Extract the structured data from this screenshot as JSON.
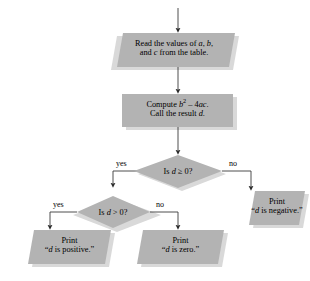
{
  "diagram": {
    "colors": {
      "shape_fill": "#b3b3b3",
      "shape_shadow": "#d9d9d9",
      "line": "#3a3a3a",
      "text": "#000000",
      "background": "#ffffff"
    },
    "nodes": {
      "input_read": {
        "type": "parallelogram",
        "line1": "Read the values of a, b,",
        "line2": "and c from the table."
      },
      "process_compute": {
        "type": "rectangle",
        "line1_prefix": "Compute ",
        "line1_base": "b",
        "line1_exponent": "2",
        "line1_suffix": " – 4ac.",
        "line2": "Call the result d."
      },
      "decision_ge_zero": {
        "type": "diamond",
        "text": "Is d ≥ 0?",
        "yes_label": "yes",
        "no_label": "no"
      },
      "decision_gt_zero": {
        "type": "diamond",
        "text": "Is d > 0?",
        "yes_label": "yes",
        "no_label": "no"
      },
      "output_negative": {
        "type": "parallelogram",
        "line1": "Print",
        "line2": "“d is negative.”"
      },
      "output_positive": {
        "type": "parallelogram",
        "line1": "Print",
        "line2": "“d is positive.”"
      },
      "output_zero": {
        "type": "parallelogram",
        "line1": "Print",
        "line2": "“d is zero.”"
      }
    }
  }
}
